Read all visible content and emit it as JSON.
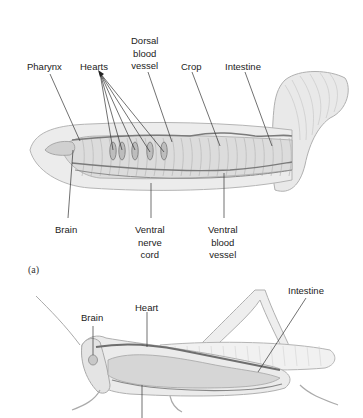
{
  "figure": {
    "panel_a": {
      "panel_label": "(a)",
      "subject": "earthworm",
      "labels": {
        "pharynx": "Pharynx",
        "hearts": "Hearts",
        "dorsal_blood_vessel": [
          "Dorsal",
          "blood",
          "vessel"
        ],
        "crop": "Crop",
        "intestine": "Intestine",
        "brain": "Brain",
        "ventral_nerve_cord": [
          "Ventral",
          "nerve",
          "cord"
        ],
        "ventral_blood_vessel": [
          "Ventral",
          "blood",
          "vessel"
        ]
      }
    },
    "panel_b": {
      "subject": "grasshopper",
      "labels": {
        "brain": "Brain",
        "heart": "Heart",
        "intestine": "Intestine"
      }
    },
    "colors": {
      "body_fill": "#e6e6e6",
      "body_outline": "#b5b5b5",
      "vessel": "#7a7a7a",
      "leader_line": "#333333"
    }
  }
}
